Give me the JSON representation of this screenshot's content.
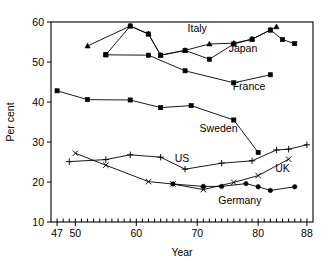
{
  "chart_data": {
    "type": "line",
    "title": "",
    "xlabel": "Year",
    "ylabel": "Per cent",
    "xlim": [
      46,
      89
    ],
    "ylim": [
      10,
      60
    ],
    "grid": false,
    "legend_position": "inline-annotations",
    "xticklabels": [
      "47",
      "50",
      "60",
      "70",
      "80",
      "88"
    ],
    "xtickvalues": [
      47,
      50,
      60,
      70,
      80,
      88
    ],
    "yticklabels": [
      "10",
      "20",
      "30",
      "40",
      "50",
      "60"
    ],
    "ytickvalues": [
      10,
      20,
      30,
      40,
      50,
      60
    ],
    "minor_xticks_every": 1,
    "series": [
      {
        "name": "Italy",
        "marker": "triangle",
        "x": [
          52,
          59,
          62,
          64,
          68,
          72,
          76,
          79,
          82,
          83
        ],
        "values": [
          54.0,
          59.0,
          57.0,
          51.7,
          52.9,
          54.5,
          54.7,
          55.7,
          58.0,
          58.8
        ]
      },
      {
        "name": "Japan",
        "marker": "square",
        "x": [
          55,
          59,
          62,
          64,
          68,
          72,
          76,
          79,
          82,
          84,
          86
        ],
        "values": [
          51.8,
          59.0,
          57.0,
          51.7,
          52.9,
          50.7,
          54.5,
          55.7,
          58.0,
          55.6,
          54.6
        ]
      },
      {
        "name": "France",
        "marker": "square",
        "x": [
          55,
          62,
          68,
          76,
          82
        ],
        "values": [
          51.8,
          51.7,
          47.8,
          44.8,
          46.8
        ]
      },
      {
        "name": "Sweden",
        "marker": "square",
        "x": [
          47,
          52,
          59,
          64,
          69,
          76,
          80
        ],
        "values": [
          42.8,
          40.6,
          40.5,
          38.6,
          39.1,
          35.5,
          27.4
        ]
      },
      {
        "name": "US",
        "marker": "plus",
        "x": [
          49,
          55,
          59,
          64,
          68,
          74,
          79,
          83,
          85,
          88
        ],
        "values": [
          25.1,
          25.6,
          26.8,
          26.2,
          23.2,
          24.7,
          25.3,
          28.0,
          28.2,
          29.3
        ]
      },
      {
        "name": "UK",
        "marker": "cross",
        "x": [
          50,
          55,
          62,
          66,
          71,
          76,
          80,
          85
        ],
        "values": [
          27.2,
          24.2,
          20.1,
          19.5,
          18.1,
          19.9,
          21.6,
          25.7
        ]
      },
      {
        "name": "Germany",
        "marker": "circle",
        "x": [
          66,
          71,
          74,
          78,
          80,
          82,
          86
        ],
        "values": [
          19.5,
          18.9,
          18.9,
          19.6,
          18.8,
          17.9,
          18.8
        ]
      }
    ],
    "annotations": [
      {
        "text": "Italy",
        "x": 70.0,
        "y": 57.6
      },
      {
        "text": "Japan",
        "x": 77.5,
        "y": 52.4
      },
      {
        "text": "France",
        "x": 78.5,
        "y": 43.0
      },
      {
        "text": "Sweden",
        "x": 73.5,
        "y": 32.5
      },
      {
        "text": "US",
        "x": 67.5,
        "y": 24.9
      },
      {
        "text": "UK",
        "x": 84.0,
        "y": 22.5
      },
      {
        "text": "Germany",
        "x": 77.0,
        "y": 14.6
      }
    ]
  },
  "colors": {
    "axis": "#000000",
    "line": "#000000",
    "background": "#ffffff"
  }
}
